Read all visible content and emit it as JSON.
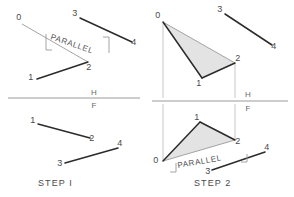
{
  "figure": {
    "background_color": "#ffffff",
    "colors": {
      "heavy_line": "#2b2b2b",
      "light_line": "#9a9a9a",
      "projection_line": "#b8b8b8",
      "reference_line": "#9a9a9a",
      "fill_gray": "#d9d9d9",
      "text": "#4a4a4a",
      "text_muted": "#6a6a6a"
    }
  },
  "reference_line": {
    "upper_label": "H",
    "lower_label": "F"
  },
  "panels": [
    {
      "id": "step-1-top",
      "quadrant": "top-left",
      "view": "horizontal",
      "step_caption": null,
      "vertices": [
        {
          "name": "0",
          "label": "0",
          "x": 22,
          "y": 24,
          "label_x": 19,
          "label_y": 20
        },
        {
          "name": "1",
          "label": "1",
          "x": 37,
          "y": 79,
          "label_x": 31,
          "label_y": 80
        },
        {
          "name": "2",
          "label": "2",
          "x": 88,
          "y": 62,
          "label_x": 89,
          "label_y": 70
        },
        {
          "name": "3",
          "label": "3",
          "x": 80,
          "y": 18,
          "label_x": 75,
          "label_y": 16
        },
        {
          "name": "4",
          "label": "4",
          "x": 132,
          "y": 42,
          "label_x": 134,
          "label_y": 45
        }
      ],
      "light_edges": [
        {
          "from": "0",
          "to": "2"
        }
      ],
      "heavy_edges": [
        {
          "from": "1",
          "to": "2"
        },
        {
          "from": "3",
          "to": "4"
        }
      ],
      "annotation": {
        "text": "PARALLEL",
        "x": 50,
        "y": 39,
        "rotation": 19,
        "tick_left": {
          "x1": 46,
          "y1": 34,
          "x2": 46,
          "y2": 50,
          "x3": 52,
          "y3": 50
        },
        "tick_right": {
          "x1": 103,
          "y1": 37,
          "x2": 109,
          "y2": 37,
          "x3": 109,
          "y3": 53
        }
      }
    },
    {
      "id": "step-1-bottom",
      "quadrant": "bottom-left",
      "view": "frontal",
      "step_caption": "STEP I",
      "caption_x": 38,
      "caption_y": 186,
      "vertices": [
        {
          "name": "1",
          "label": "1",
          "x": 38,
          "y": 124,
          "label_x": 33,
          "label_y": 123
        },
        {
          "name": "2",
          "label": "2",
          "x": 90,
          "y": 138,
          "label_x": 92,
          "label_y": 141
        },
        {
          "name": "3",
          "label": "3",
          "x": 65,
          "y": 163,
          "label_x": 60,
          "label_y": 166
        },
        {
          "name": "4",
          "label": "4",
          "x": 118,
          "y": 148,
          "label_x": 120,
          "label_y": 146
        }
      ],
      "light_edges": [],
      "heavy_edges": [
        {
          "from": "1",
          "to": "2"
        },
        {
          "from": "3",
          "to": "4"
        }
      ],
      "annotation": null
    },
    {
      "id": "step-2-top",
      "quadrant": "top-right",
      "view": "horizontal",
      "step_caption": null,
      "vertices": [
        {
          "name": "0",
          "label": "0",
          "x": 163,
          "y": 22,
          "label_x": 158,
          "label_y": 18
        },
        {
          "name": "1",
          "label": "1",
          "x": 202,
          "y": 78,
          "label_x": 199,
          "label_y": 86
        },
        {
          "name": "2",
          "label": "2",
          "x": 235,
          "y": 63,
          "label_x": 238,
          "label_y": 61
        },
        {
          "name": "3",
          "label": "3",
          "x": 225,
          "y": 14,
          "label_x": 220,
          "label_y": 12
        },
        {
          "name": "4",
          "label": "4",
          "x": 272,
          "y": 45,
          "label_x": 274,
          "label_y": 49
        }
      ],
      "filled_polygon": [
        "0",
        "1",
        "2"
      ],
      "light_edges": [
        {
          "from": "0",
          "to": "2"
        }
      ],
      "heavy_edges": [
        {
          "from": "0",
          "to": "1"
        },
        {
          "from": "1",
          "to": "2"
        },
        {
          "from": "3",
          "to": "4"
        }
      ],
      "projectors": [
        {
          "x": 163,
          "y1": 22,
          "y2": 98
        },
        {
          "x": 235,
          "y1": 63,
          "y2": 98
        }
      ],
      "annotation": null
    },
    {
      "id": "step-2-bottom",
      "quadrant": "bottom-right",
      "view": "frontal",
      "step_caption": "STEP 2",
      "caption_x": 194,
      "caption_y": 186,
      "vertices": [
        {
          "name": "0",
          "label": "0",
          "x": 163,
          "y": 161,
          "label_x": 156,
          "label_y": 163
        },
        {
          "name": "1",
          "label": "1",
          "x": 200,
          "y": 122,
          "label_x": 197,
          "label_y": 120
        },
        {
          "name": "2",
          "label": "2",
          "x": 235,
          "y": 140,
          "label_x": 238,
          "label_y": 144
        },
        {
          "name": "3",
          "label": "3",
          "x": 212,
          "y": 170,
          "label_x": 208,
          "label_y": 174
        },
        {
          "name": "4",
          "label": "4",
          "x": 265,
          "y": 152,
          "label_x": 267,
          "label_y": 150
        }
      ],
      "filled_polygon": [
        "0",
        "1",
        "2"
      ],
      "light_edges": [
        {
          "from": "0",
          "to": "2"
        }
      ],
      "heavy_edges": [
        {
          "from": "0",
          "to": "1"
        },
        {
          "from": "1",
          "to": "2"
        },
        {
          "from": "3",
          "to": "4"
        }
      ],
      "projectors": [
        {
          "x": 163,
          "y1": 104,
          "y2": 161
        },
        {
          "x": 235,
          "y1": 104,
          "y2": 140
        }
      ],
      "annotation": {
        "text": "PARALLEL",
        "x": 178,
        "y": 168,
        "rotation": -10,
        "tick_left": {
          "x1": 170,
          "y1": 172,
          "x2": 176,
          "y2": 172,
          "x3": 176,
          "y3": 163
        },
        "tick_right": {
          "x1": 241,
          "y1": 162,
          "x2": 247,
          "y2": 162,
          "x3": 247,
          "y3": 154
        }
      }
    }
  ],
  "reference_lines": [
    {
      "id": "ref-left",
      "x1": 8,
      "y1": 98,
      "x2": 140,
      "y2": 98
    },
    {
      "id": "ref-right",
      "x1": 152,
      "y1": 101,
      "x2": 288,
      "y2": 101
    }
  ],
  "hf_markers": [
    {
      "id": "hf-left",
      "h_x": 94,
      "h_y": 95,
      "f_x": 94,
      "f_y": 108
    },
    {
      "id": "hf-right",
      "h_x": 248,
      "h_y": 97,
      "f_x": 248,
      "f_y": 111
    }
  ]
}
